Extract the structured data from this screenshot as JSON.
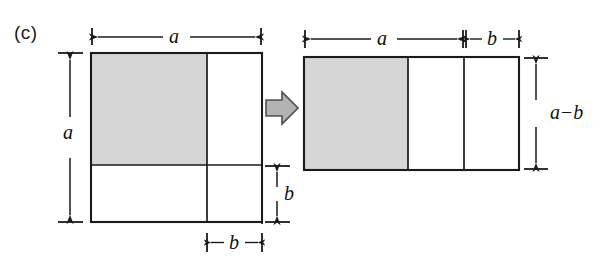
{
  "figure": {
    "panel_label": "(c)",
    "type": "geometric-proof-diagram",
    "colors": {
      "background": "#ffffff",
      "shaded_fill": "#d6d6d6",
      "stroke": "#1a1a1a",
      "arrow_fill": "#b3b3b3",
      "arrow_stroke": "#4d4d4d"
    },
    "left_shape": {
      "name": "square",
      "side_label": "a",
      "top_dimension": "a",
      "left_dimension": "a",
      "bottom_dimension": "b",
      "right_dimension": "b",
      "regions": [
        {
          "name": "shaded-large-square",
          "fill": "shaded",
          "width_label": "a - b",
          "height_label": "a - b"
        },
        {
          "name": "right-strip",
          "fill": "white",
          "width_label": "b",
          "height_label": "a - b"
        },
        {
          "name": "bottom-strip",
          "fill": "white",
          "width_label": "a - b",
          "height_label": "b"
        },
        {
          "name": "removed-corner-square",
          "fill": "none",
          "width_label": "b",
          "height_label": "b",
          "border": "dashed"
        }
      ]
    },
    "transform_arrow": {
      "name": "rightwards-block-arrow",
      "direction": "right"
    },
    "right_shape": {
      "name": "rectangle",
      "top_dimensions": [
        "a",
        "b"
      ],
      "right_dimension": "a - b",
      "regions": [
        {
          "name": "shaded-square",
          "fill": "shaded",
          "width_label": "a - b",
          "height_label": "a - b"
        },
        {
          "name": "middle-strip",
          "fill": "white",
          "width_label": "b",
          "height_label": "a - b"
        },
        {
          "name": "end-strip",
          "fill": "white",
          "width_label": "b",
          "height_label": "a - b"
        }
      ]
    },
    "labels": {
      "a": "a",
      "b": "b",
      "a_minus_b_var1": "a",
      "a_minus_b_op": "−",
      "a_minus_b_var2": "b"
    }
  }
}
